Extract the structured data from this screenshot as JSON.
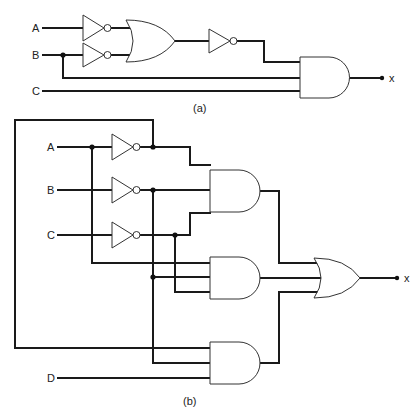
{
  "circuit_a": {
    "caption": "(a)",
    "inputs": [
      "A",
      "B",
      "C"
    ],
    "output": "x",
    "gates": [
      "NOT(A)",
      "NOT(B)",
      "OR",
      "NOT",
      "AND"
    ]
  },
  "circuit_b": {
    "caption": "(b)",
    "inputs": [
      "A",
      "B",
      "C",
      "D"
    ],
    "output": "x",
    "gates": [
      "NOT(A)",
      "NOT(B)",
      "NOT(C)",
      "AND1",
      "AND2",
      "AND3",
      "OR"
    ]
  },
  "colors": {
    "wire": "#1a1a1a",
    "gate_outline": "#333333",
    "background": "#ffffff"
  }
}
